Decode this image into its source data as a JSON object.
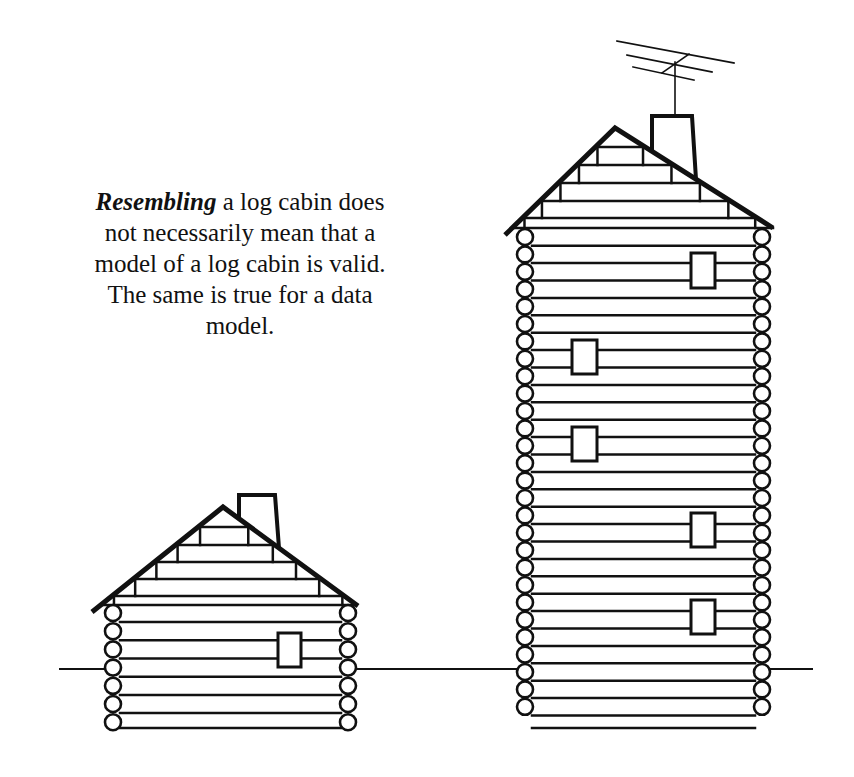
{
  "caption": {
    "emphasis": "Resembling",
    "line1_rest": " a log cabin does",
    "line2": "not necessarily mean that a",
    "line3": "model of a log cabin is valid.",
    "line4": "The same is true for a data",
    "line5": "model."
  },
  "colors": {
    "ink": "#111111",
    "background": "#ffffff"
  },
  "figures": {
    "ground": {
      "x1": 60,
      "x2": 812,
      "y": 669
    },
    "small_cabin": {
      "roof": {
        "apex": [
          223,
          507
        ],
        "left": [
          92,
          612
        ],
        "right": [
          358,
          606
        ]
      },
      "wall": {
        "x1": 113,
        "x2": 347,
        "top": 605,
        "bottom": 728
      },
      "corner_circles": {
        "left_x": 113,
        "right_x": 348,
        "r": 8,
        "count": 7,
        "first_y": 613,
        "spacing": 18.2
      },
      "gable_rows_y": [
        527,
        545,
        562,
        579,
        596
      ],
      "chimney": {
        "x1": 239,
        "x2": 275,
        "top": 495
      },
      "windows": [
        {
          "x": 278,
          "y": 633,
          "w": 23,
          "h": 34
        }
      ]
    },
    "tall_cabin": {
      "roof": {
        "apex": [
          615,
          128
        ],
        "left": [
          505,
          235
        ],
        "right": [
          773,
          228
        ]
      },
      "wall": {
        "x1": 527,
        "x2": 760,
        "top": 228,
        "bottom": 728
      },
      "corner_circles": {
        "left_x": 525,
        "right_x": 762,
        "r": 8,
        "count": 28,
        "first_y": 237,
        "spacing": 17.4
      },
      "gable_rows_y": [
        147,
        165,
        183,
        201,
        218
      ],
      "chimney": {
        "x1": 652,
        "x2": 692,
        "top": 116
      },
      "antenna": {
        "mast_x": 675,
        "mast_top": 58,
        "mast_bottom": 116
      },
      "windows": [
        {
          "x": 691,
          "y": 253,
          "w": 24,
          "h": 35
        },
        {
          "x": 572,
          "y": 340,
          "w": 25,
          "h": 34
        },
        {
          "x": 572,
          "y": 427,
          "w": 25,
          "h": 34
        },
        {
          "x": 691,
          "y": 513,
          "w": 24,
          "h": 34
        },
        {
          "x": 691,
          "y": 600,
          "w": 24,
          "h": 34
        }
      ]
    }
  }
}
